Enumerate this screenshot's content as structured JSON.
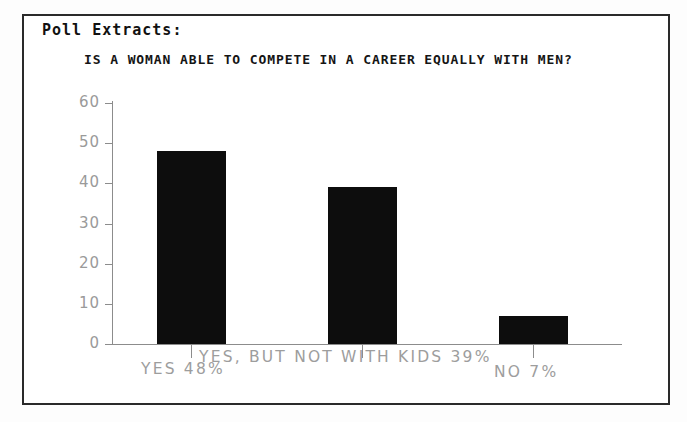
{
  "header": {
    "label": "Poll Extracts:"
  },
  "chart_data": {
    "type": "bar",
    "title": "IS A WOMAN ABLE TO COMPETE IN A CAREER EQUALLY WITH MEN?",
    "xlabel": "",
    "ylabel": "",
    "categories": [
      "YES 48%",
      "YES, BUT NOT WITH KIDS 39%",
      "NO 7%"
    ],
    "category_short": [
      "YES",
      "YES, BUT NOT WITH KIDS",
      "NO"
    ],
    "values": [
      48,
      39,
      7
    ],
    "value_labels": [
      "48%",
      "39%",
      "7%"
    ],
    "ylim": [
      0,
      60
    ],
    "yticks": [
      0,
      10,
      20,
      30,
      40,
      50,
      60
    ],
    "ytick_labels": [
      "0",
      "10",
      "20",
      "30",
      "40",
      "50",
      "60"
    ],
    "grid": false,
    "legend": null,
    "bar_color": "#0d0d0d",
    "axis_color": "#8c8c8c",
    "label_color": "#9d9d9d",
    "background": "#ffffff"
  },
  "frame": {
    "border_color": "#2a2a2a"
  }
}
